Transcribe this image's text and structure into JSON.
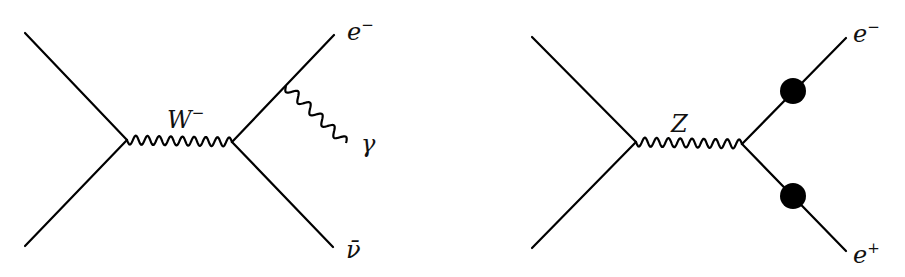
{
  "diagrams": [
    {
      "id": "w-decay-radiative",
      "propagator": {
        "particle": "W",
        "charge": "−",
        "label": "W",
        "sup": "−"
      },
      "incoming": [
        "line-top-left",
        "line-bottom-left"
      ],
      "outgoing": [
        {
          "particle": "electron",
          "label": "e",
          "sup": "−"
        },
        {
          "particle": "antineutrino",
          "label": "ν̄",
          "sup": ""
        }
      ],
      "radiation": {
        "particle": "photon",
        "label": "γ"
      }
    },
    {
      "id": "z-decay",
      "propagator": {
        "particle": "Z",
        "label": "Z",
        "sup": ""
      },
      "incoming": [
        "line-top-left",
        "line-bottom-left"
      ],
      "outgoing": [
        {
          "particle": "electron",
          "label": "e",
          "sup": "−"
        },
        {
          "particle": "positron",
          "label": "e",
          "sup": "+"
        }
      ],
      "blobs": 2
    }
  ],
  "colors": {
    "ink": "#000000",
    "background": "#ffffff"
  }
}
